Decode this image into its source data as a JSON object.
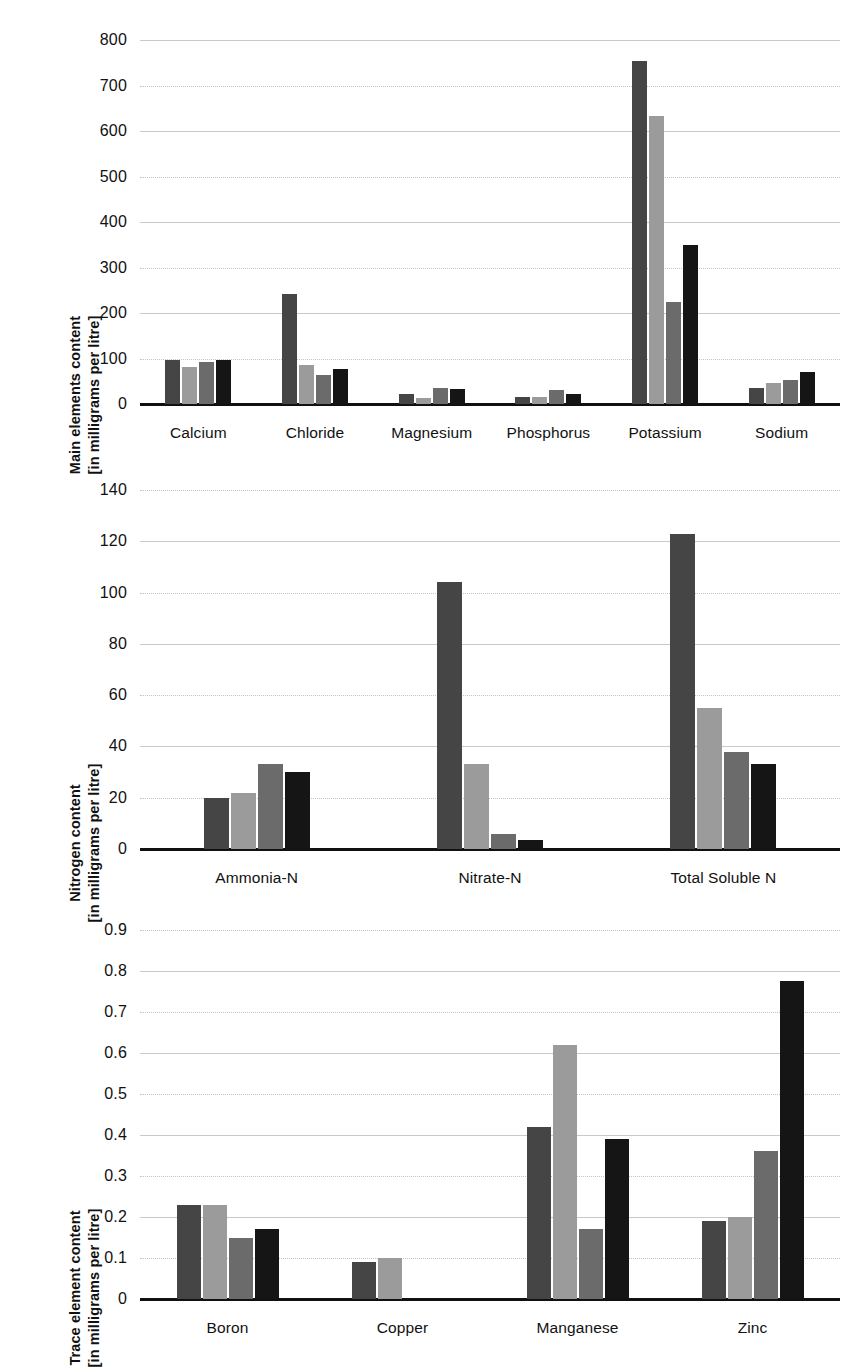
{
  "series_colors": [
    "#454545",
    "#9b9b9b",
    "#6b6b6b",
    "#151515"
  ],
  "series_names": [
    "series-1",
    "series-2",
    "series-3",
    "series-4"
  ],
  "panels": [
    {
      "id": "main-elements",
      "ylabel_line1": "Main elements content",
      "ylabel_line2": "[in milligrams per litre]"
    },
    {
      "id": "nitrogen",
      "ylabel_line1": "Nitrogen content",
      "ylabel_line2": "[in milligrams per litre]"
    },
    {
      "id": "trace-elements",
      "ylabel_line1": "Trace element content",
      "ylabel_line2": "[in milligrams per litre]"
    }
  ],
  "chart_data": [
    {
      "type": "bar",
      "title": "",
      "xlabel": "",
      "ylabel": "Main elements content [in milligrams per litre]",
      "ylim": [
        0,
        800
      ],
      "yticks": [
        0,
        100,
        200,
        300,
        400,
        500,
        600,
        700,
        800
      ],
      "yticklabels": [
        "0",
        "100",
        "200",
        "300",
        "400",
        "500",
        "600",
        "700",
        "800"
      ],
      "grid": true,
      "legend": "none",
      "categories": [
        "Calcium",
        "Chloride",
        "Magnesium",
        "Phosphorus",
        "Potassium",
        "Sodium"
      ],
      "series": [
        {
          "name": "series-1",
          "values": [
            96,
            241,
            21,
            16,
            753,
            36
          ]
        },
        {
          "name": "series-2",
          "values": [
            81,
            85,
            14,
            15,
            632,
            46
          ]
        },
        {
          "name": "series-3",
          "values": [
            92,
            64,
            35,
            30,
            224,
            53
          ]
        },
        {
          "name": "series-4",
          "values": [
            97,
            77,
            34,
            21,
            350,
            70
          ]
        }
      ]
    },
    {
      "type": "bar",
      "title": "",
      "xlabel": "",
      "ylabel": "Nitrogen content [in milligrams per litre]",
      "ylim": [
        0,
        140
      ],
      "yticks": [
        0,
        20,
        40,
        60,
        80,
        100,
        120,
        140
      ],
      "yticklabels": [
        "0",
        "20",
        "40",
        "60",
        "80",
        "100",
        "120",
        "140"
      ],
      "grid": true,
      "legend": "none",
      "categories": [
        "Ammonia-N",
        "Nitrate-N",
        "Total Soluble N"
      ],
      "series": [
        {
          "name": "series-1",
          "values": [
            20,
            104,
            123
          ]
        },
        {
          "name": "series-2",
          "values": [
            22,
            33,
            55
          ]
        },
        {
          "name": "series-3",
          "values": [
            33,
            6,
            38
          ]
        },
        {
          "name": "series-4",
          "values": [
            30,
            3.5,
            33
          ]
        }
      ]
    },
    {
      "type": "bar",
      "title": "",
      "xlabel": "",
      "ylabel": "Trace element content [in milligrams per litre]",
      "ylim": [
        0,
        0.9
      ],
      "yticks": [
        0,
        0.1,
        0.2,
        0.3,
        0.4,
        0.5,
        0.6,
        0.7,
        0.8,
        0.9
      ],
      "yticklabels": [
        "0",
        "0.1",
        "0.2",
        "0.3",
        "0.4",
        "0.5",
        "0.6",
        "0.7",
        "0.8",
        "0.9"
      ],
      "grid": true,
      "legend": "none",
      "categories": [
        "Boron",
        "Copper",
        "Manganese",
        "Zinc"
      ],
      "series": [
        {
          "name": "series-1",
          "values": [
            0.23,
            0.09,
            0.42,
            0.19
          ]
        },
        {
          "name": "series-2",
          "values": [
            0.23,
            0.1,
            0.62,
            0.2
          ]
        },
        {
          "name": "series-3",
          "values": [
            0.15,
            0,
            0.17,
            0.36
          ]
        },
        {
          "name": "series-4",
          "values": [
            0.17,
            0,
            0.39,
            0.775
          ]
        }
      ]
    }
  ]
}
